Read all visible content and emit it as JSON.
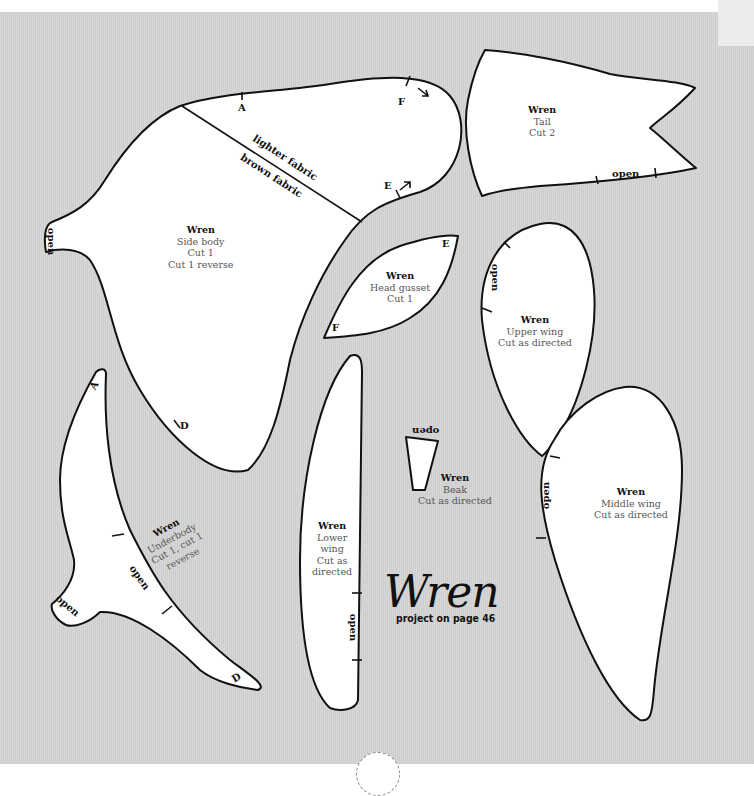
{
  "document": {
    "title": "Wren",
    "subtitle": "project on page 46"
  },
  "pieces": {
    "side_body": {
      "name": "Wren",
      "lines": [
        "Side body",
        "Cut 1",
        "Cut 1 reverse"
      ],
      "marks": [
        "A",
        "F",
        "E",
        "D",
        "open"
      ],
      "divider_above": "lighter fabric",
      "divider_below": "brown fabric"
    },
    "tail": {
      "name": "Wren",
      "lines": [
        "Tail",
        "Cut 2"
      ],
      "marks": [
        "open"
      ]
    },
    "head_gusset": {
      "name": "Wren",
      "lines": [
        "Head gusset",
        "Cut 1"
      ],
      "marks": [
        "E",
        "F"
      ]
    },
    "upper_wing": {
      "name": "Wren",
      "lines": [
        "Upper wing",
        "Cut as directed"
      ],
      "marks": [
        "open"
      ]
    },
    "underbody": {
      "name": "Wren",
      "lines": [
        "Underbody",
        "Cut 1, cut 1",
        "reverse"
      ],
      "marks": [
        "A",
        "D",
        "open",
        "open"
      ]
    },
    "lower_wing": {
      "name": "Wren",
      "lines": [
        "Lower",
        "wing",
        "Cut as",
        "directed"
      ],
      "marks": [
        "open"
      ]
    },
    "beak": {
      "name": "Wren",
      "lines": [
        "Beak",
        "Cut as directed"
      ],
      "marks": [
        "open"
      ]
    },
    "middle_wing": {
      "name": "Wren",
      "lines": [
        "Middle wing",
        "Cut as directed"
      ],
      "marks": [
        "open"
      ]
    }
  }
}
